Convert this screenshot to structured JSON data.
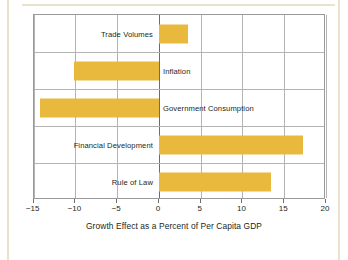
{
  "chart_data": {
    "type": "bar",
    "orientation": "horizontal",
    "title": "",
    "xlabel": "Growth Effect as a Percent of Per Capita GDP",
    "ylabel": "",
    "categories": [
      "Trade Volumes",
      "Inflation",
      "Government Consumption",
      "Financial Development",
      "Rule of Law"
    ],
    "values": [
      3.5,
      -10.2,
      -14.3,
      17.3,
      13.4
    ],
    "xlim": [
      -15,
      20
    ],
    "xticks": [
      -15,
      -10,
      -5,
      0,
      5,
      10,
      15,
      20
    ],
    "xtick_labels": [
      "−15",
      "−10",
      "−5",
      "0",
      "5",
      "10",
      "15",
      "20"
    ],
    "grid": true,
    "legend": null,
    "bar_color": "#e8b93c",
    "axis_color": "#9a9a9a",
    "grid_color": "#b3b3b3",
    "zero_line_color": "#6d6d6d",
    "text_color": "#231f20",
    "background": "#ffffff",
    "frame_color": "#e9e2cc"
  }
}
